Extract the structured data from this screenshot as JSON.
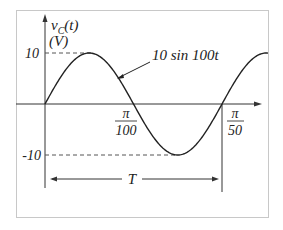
{
  "chart_data": {
    "type": "line",
    "title": "",
    "ylabel_line1": "v_C(t)",
    "ylabel_v": "v",
    "ylabel_sub": "C",
    "ylabel_arg": "(t)",
    "ylabel_unit": "(V)",
    "xlabel": "",
    "function_label": "10 sin 100t",
    "y_ticks": [
      "10",
      "-10"
    ],
    "x_ticks": [
      {
        "num": "π",
        "den": "100"
      },
      {
        "num": "π",
        "den": "50"
      }
    ],
    "period_label": "T",
    "amplitude": 10,
    "angular_frequency": 100,
    "x": [
      0,
      0.00785,
      0.0157,
      0.02356,
      0.0314,
      0.0393
    ],
    "values": [
      0,
      10,
      0,
      -10,
      0,
      10
    ],
    "ylim": [
      -10,
      10
    ],
    "grid": false,
    "legend": "none"
  },
  "colors": {
    "curve": "#222222",
    "axis": "#333333",
    "dashed": "#555555",
    "frame": "#cccccc"
  }
}
